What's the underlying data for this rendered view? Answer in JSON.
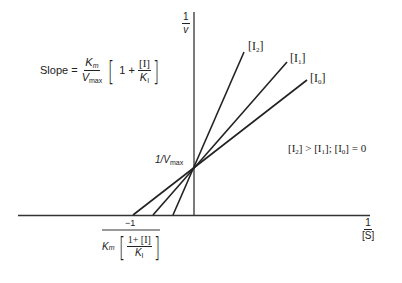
{
  "axes": {
    "y_label_num": "1",
    "y_label_den": "v",
    "x_label_num": "1",
    "x_label_den": "[S]"
  },
  "slope_equation": {
    "prefix": "Slope =",
    "km": "K",
    "km_sub": "m",
    "vmax": "V",
    "vmax_sub": "max",
    "one_plus": "1 +",
    "inhib": "[I]",
    "ki": "K",
    "ki_sub": "I"
  },
  "intercept_label": {
    "text": "1/V",
    "sub": "max"
  },
  "x_intercept_label": {
    "numerator": "−1",
    "km": "K",
    "km_sub": "m",
    "inner_num": "1+ [I]",
    "ki": "K",
    "ki_sub": "I"
  },
  "lines": [
    {
      "label": "[I",
      "sub": "2",
      "close": "]"
    },
    {
      "label": "[I",
      "sub": "1",
      "close": "]"
    },
    {
      "label": "[I",
      "sub": "0",
      "close": "]"
    }
  ],
  "condition": {
    "i2": "[I",
    "i2_sub": "2",
    "gt": "] > [I",
    "i1_sub": "1",
    "sep": "];  [I",
    "i0_sub": "0",
    "eq": "] = 0"
  },
  "colors": {
    "line": "#222222",
    "background": "#ffffff"
  }
}
